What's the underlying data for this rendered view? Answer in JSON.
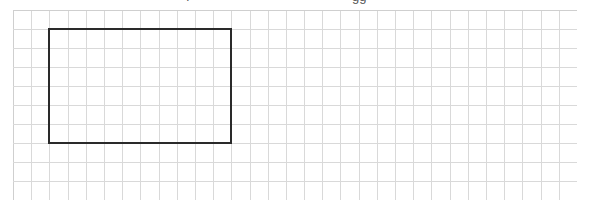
{
  "figure": {
    "type": "grid-paper-with-rectangle",
    "grid": {
      "columns": 31,
      "rows": 10,
      "line_color": "#d9d9d9",
      "border_color": "#cfcfcf"
    },
    "rectangle": {
      "start_col": 2,
      "start_row": 1,
      "width_cells": 10,
      "height_cells": 6,
      "stroke_color": "#2a2a2a"
    },
    "clipped_caption_fragments": [
      "ı",
      "·",
      "gg"
    ]
  }
}
